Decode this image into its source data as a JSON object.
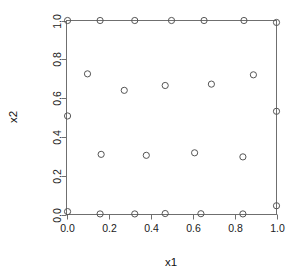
{
  "chart_data": {
    "type": "scatter",
    "title": "",
    "subtitle": "",
    "xlabel": "x1",
    "ylabel": "x2",
    "xlim": [
      0.0,
      1.0
    ],
    "ylim": [
      0.0,
      1.0
    ],
    "grid": false,
    "legend": false,
    "legend_position": "none",
    "marker": "open-circle",
    "marker_color": "#555555",
    "frame_color": "#6f6f6f",
    "background": "#ffffff",
    "xticks": [
      0.0,
      0.2,
      0.4,
      0.6,
      0.8,
      1.0
    ],
    "yticks": [
      0.0,
      0.2,
      0.4,
      0.6,
      0.8,
      1.0
    ],
    "xtick_labels": [
      "0.0",
      "0.2",
      "0.4",
      "0.6",
      "0.8",
      "1.0"
    ],
    "ytick_labels": [
      "0.0",
      "0.2",
      "0.4",
      "0.6",
      "0.8",
      "1.0"
    ],
    "ylabel_rotated": true,
    "n_points": 25,
    "points": [
      {
        "x": 0.005,
        "y": 1.0
      },
      {
        "x": 0.16,
        "y": 1.0
      },
      {
        "x": 0.325,
        "y": 1.0
      },
      {
        "x": 0.5,
        "y": 1.0
      },
      {
        "x": 0.655,
        "y": 1.0
      },
      {
        "x": 0.845,
        "y": 1.0
      },
      {
        "x": 1.0,
        "y": 0.99
      },
      {
        "x": 0.1,
        "y": 0.725
      },
      {
        "x": 0.89,
        "y": 0.72
      },
      {
        "x": 0.69,
        "y": 0.672
      },
      {
        "x": 0.47,
        "y": 0.665
      },
      {
        "x": 0.275,
        "y": 0.64
      },
      {
        "x": 0.005,
        "y": 0.508
      },
      {
        "x": 1.0,
        "y": 0.532
      },
      {
        "x": 0.165,
        "y": 0.31
      },
      {
        "x": 0.38,
        "y": 0.305
      },
      {
        "x": 0.61,
        "y": 0.318
      },
      {
        "x": 0.84,
        "y": 0.297
      },
      {
        "x": 0.005,
        "y": 0.015
      },
      {
        "x": 0.16,
        "y": 0.003
      },
      {
        "x": 0.325,
        "y": 0.003
      },
      {
        "x": 0.47,
        "y": 0.005
      },
      {
        "x": 0.64,
        "y": 0.004
      },
      {
        "x": 0.84,
        "y": 0.003
      },
      {
        "x": 1.0,
        "y": 0.045
      }
    ]
  },
  "axes": {
    "x_title": "x1",
    "y_title": "x2"
  }
}
